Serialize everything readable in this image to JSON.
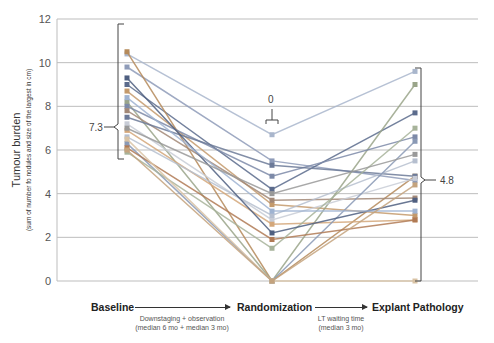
{
  "chart_data": {
    "type": "line",
    "title": "",
    "ylabel": "Tumour burden",
    "ylabel_sub": "(sum of number fo nodules and size of the largest in cm)",
    "xlabel": "",
    "categories": [
      "Baseline",
      "Randomization",
      "Explant Pathology"
    ],
    "ylim": [
      0,
      12
    ],
    "yticks": [
      0,
      2,
      4,
      6,
      8,
      10,
      12
    ],
    "grid": true,
    "legend": "none",
    "annotations": [
      {
        "label": "7.3",
        "at": "Baseline",
        "type": "bracket",
        "range": [
          5.6,
          10.5
        ]
      },
      {
        "label": "0",
        "at": "Randomization",
        "type": "bracket-top",
        "y": 6.9
      },
      {
        "label": "4.8",
        "at": "Explant Pathology",
        "type": "bracket",
        "range": [
          0,
          9.6
        ]
      }
    ],
    "series": [
      {
        "name": "p1",
        "color": "#a9b6cc",
        "values": [
          10.4,
          6.7,
          9.6
        ]
      },
      {
        "name": "p2",
        "color": "#8e9bb8",
        "values": [
          9.8,
          5.5,
          4.6
        ]
      },
      {
        "name": "p3",
        "color": "#5b6b8c",
        "values": [
          9.0,
          4.2,
          7.7
        ]
      },
      {
        "name": "p4",
        "color": "#b58a5a",
        "values": [
          10.5,
          0,
          4.8
        ]
      },
      {
        "name": "p5",
        "color": "#c49a6c",
        "values": [
          8.7,
          3.5,
          3.0
        ]
      },
      {
        "name": "p6",
        "color": "#9aa58a",
        "values": [
          8.2,
          0,
          9.0
        ]
      },
      {
        "name": "p7",
        "color": "#7d8aa8",
        "values": [
          8.0,
          4.8,
          6.6
        ]
      },
      {
        "name": "p8",
        "color": "#a28877",
        "values": [
          7.8,
          3.7,
          3.8
        ]
      },
      {
        "name": "p9",
        "color": "#6c7a98",
        "values": [
          7.5,
          5.3,
          4.8
        ]
      },
      {
        "name": "p10",
        "color": "#c8ccd6",
        "values": [
          7.2,
          2.8,
          4.7
        ]
      },
      {
        "name": "p11",
        "color": "#d4a77a",
        "values": [
          6.9,
          2.6,
          2.8
        ]
      },
      {
        "name": "p12",
        "color": "#b6bfcf",
        "values": [
          6.6,
          3.0,
          5.5
        ]
      },
      {
        "name": "p13",
        "color": "#8a99b5",
        "values": [
          6.3,
          0,
          6.4
        ]
      },
      {
        "name": "p14",
        "color": "#b07a55",
        "values": [
          6.1,
          1.9,
          2.8
        ]
      },
      {
        "name": "p15",
        "color": "#a7b39a",
        "values": [
          5.9,
          1.5,
          7.0
        ]
      },
      {
        "name": "p16",
        "color": "#4f5f80",
        "values": [
          9.3,
          2.2,
          3.7
        ]
      },
      {
        "name": "p17",
        "color": "#9fb3d1",
        "values": [
          8.4,
          3.2,
          3.2
        ]
      },
      {
        "name": "p18",
        "color": "#d9c3a5",
        "values": [
          6.5,
          0,
          0
        ]
      },
      {
        "name": "p19",
        "color": "#999999",
        "values": [
          7.0,
          4.0,
          5.8
        ]
      },
      {
        "name": "p20",
        "color": "#c4a37e",
        "values": [
          6.0,
          0,
          4.4
        ]
      }
    ]
  },
  "axis": {
    "ylabel": "Tumour burden",
    "ylabel_sub": "(sum of number fo nodules and size of the largest in cm)",
    "ticks": [
      "0",
      "2",
      "4",
      "6",
      "8",
      "10",
      "12"
    ]
  },
  "annotations": {
    "baseline_median": "7.3",
    "randomization_median": "0",
    "explant_median": "4.8"
  },
  "timeline": {
    "phase1": "Baseline",
    "phase2": "Randomization",
    "phase3": "Explant Pathology",
    "interval1_line1": "Downstaging + observation",
    "interval1_line2": "(median 6 mo + median 3 mo)",
    "interval2_line1": "LT waiting time",
    "interval2_line2": "(median 3 mo)"
  }
}
